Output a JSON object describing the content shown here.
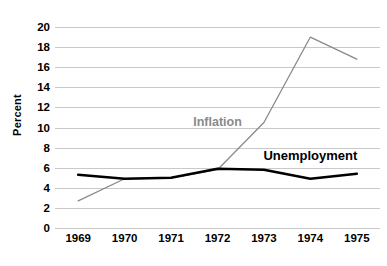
{
  "chart_data": {
    "type": "line",
    "title": "",
    "subtitle": "",
    "xlabel": "",
    "ylabel": "Percent",
    "categories": [
      "1969",
      "1970",
      "1971",
      "1972",
      "1973",
      "1974",
      "1975"
    ],
    "x": [
      1969,
      1970,
      1971,
      1972,
      1973,
      1974,
      1975
    ],
    "ylim": [
      0,
      20
    ],
    "ytick_step": 2,
    "yticks": [
      "20",
      "18",
      "16",
      "14",
      "12",
      "10",
      "8",
      "6",
      "4",
      "2",
      "0"
    ],
    "grid": "horizontal",
    "legend_position": "inline-labels",
    "series": [
      {
        "name": "Inflation",
        "color": "#8a8a8a",
        "line_width": 1.3,
        "values": [
          2.7,
          4.9,
          5.0,
          5.8,
          10.5,
          19.0,
          16.8
        ],
        "label_at": {
          "x": 1972.0,
          "y": 10.5
        }
      },
      {
        "name": "Unemployment",
        "color": "#000000",
        "line_width": 2.6,
        "values": [
          5.3,
          4.9,
          5.0,
          5.9,
          5.8,
          4.9,
          5.4
        ],
        "label_at": {
          "x": 1974.0,
          "y": 7.3
        }
      }
    ],
    "annotations": [],
    "colors": {
      "background": "#ffffff",
      "gridline": "#c9c9c9",
      "axis_text": "#000000",
      "inflation": "#8a8a8a",
      "unemployment": "#000000"
    }
  }
}
